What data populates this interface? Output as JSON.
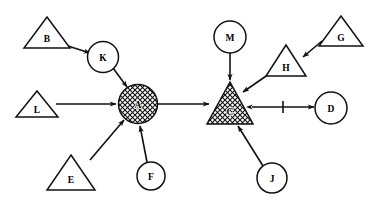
{
  "diagram": {
    "background_color": "#ffffff",
    "stroke_color": "#111111",
    "fill_color": "#ffffff",
    "hatch_fill_label": "cross-hatch",
    "nodes": [
      {
        "id": "B",
        "label": "B",
        "shape": "triangle",
        "fill": "plain",
        "cx": 47,
        "cy": 33,
        "r": 23,
        "h": 31
      },
      {
        "id": "K",
        "label": "K",
        "shape": "circle",
        "fill": "plain",
        "cx": 103,
        "cy": 57,
        "r": 15.5
      },
      {
        "id": "L",
        "label": "L",
        "shape": "triangle",
        "fill": "plain",
        "cx": 37,
        "cy": 104,
        "r": 21,
        "h": 27
      },
      {
        "id": "A",
        "label": "A",
        "shape": "circle",
        "fill": "hatched",
        "cx": 138,
        "cy": 104,
        "r": 19.5
      },
      {
        "id": "E",
        "label": "E",
        "shape": "triangle",
        "fill": "plain",
        "cx": 71,
        "cy": 173,
        "r": 24,
        "h": 35
      },
      {
        "id": "F",
        "label": "F",
        "shape": "circle",
        "fill": "plain",
        "cx": 151,
        "cy": 176,
        "r": 14
      },
      {
        "id": "M",
        "label": "M",
        "shape": "circle",
        "fill": "plain",
        "cx": 230,
        "cy": 37,
        "r": 16
      },
      {
        "id": "C",
        "label": "C",
        "shape": "triangle",
        "fill": "hatched",
        "cx": 230,
        "cy": 104,
        "r": 23,
        "h": 42
      },
      {
        "id": "H",
        "label": "H",
        "shape": "triangle",
        "fill": "plain",
        "cx": 286,
        "cy": 61,
        "r": 20,
        "h": 31
      },
      {
        "id": "G",
        "label": "G",
        "shape": "triangle",
        "fill": "plain",
        "cx": 341,
        "cy": 31,
        "r": 22,
        "h": 30
      },
      {
        "id": "J",
        "label": "J",
        "shape": "circle",
        "fill": "plain",
        "cx": 272,
        "cy": 178,
        "r": 15
      },
      {
        "id": "D",
        "label": "D",
        "shape": "circle",
        "fill": "plain",
        "cx": 331,
        "cy": 108,
        "r": 16
      }
    ],
    "edges": [
      {
        "from": "B",
        "to": "K",
        "arrow": "single",
        "tick": false
      },
      {
        "from": "K",
        "to": "A",
        "arrow": "single",
        "tick": false
      },
      {
        "from": "L",
        "to": "A",
        "arrow": "single",
        "tick": false
      },
      {
        "from": "E",
        "to": "A",
        "arrow": "single",
        "tick": false
      },
      {
        "from": "F",
        "to": "A",
        "arrow": "single",
        "tick": false
      },
      {
        "from": "A",
        "to": "C",
        "arrow": "single",
        "tick": false
      },
      {
        "from": "M",
        "to": "C",
        "arrow": "single",
        "tick": false
      },
      {
        "from": "G",
        "to": "H",
        "arrow": "single",
        "tick": false
      },
      {
        "from": "H",
        "to": "C",
        "arrow": "single",
        "tick": false
      },
      {
        "from": "J",
        "to": "C",
        "arrow": "single",
        "tick": false
      },
      {
        "from": "C",
        "to": "D",
        "arrow": "double",
        "tick": true
      }
    ]
  }
}
